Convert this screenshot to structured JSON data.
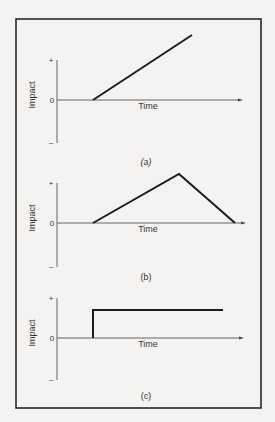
{
  "figure": {
    "frame": {
      "x": 16,
      "y": 19,
      "w": 245,
      "h": 389
    },
    "panels": [
      {
        "id": "a",
        "caption": "(a)",
        "caption_italic": true,
        "y_axis_label": "Impact",
        "x_axis_label": "Time",
        "tick_plus": "+",
        "tick_zero": "0",
        "tick_minus": "–",
        "axis_x": 57,
        "axis_top": 60,
        "zero_y": 100,
        "axis_bottom": 143,
        "arrow_end_x": 243,
        "curve_points": [
          [
            93,
            100
          ],
          [
            192,
            35
          ]
        ],
        "caption_y": 165,
        "time_y": 109
      },
      {
        "id": "b",
        "caption": "(b)",
        "caption_italic": false,
        "y_axis_label": "Impact",
        "x_axis_label": "Time",
        "tick_plus": "+",
        "tick_zero": "0",
        "tick_minus": "–",
        "axis_x": 57,
        "axis_top": 183,
        "zero_y": 223,
        "axis_bottom": 267,
        "arrow_end_x": 246,
        "curve_points": [
          [
            93,
            223
          ],
          [
            179,
            174
          ],
          [
            235,
            223
          ]
        ],
        "caption_y": 280,
        "time_y": 232
      },
      {
        "id": "c",
        "caption": "(c)",
        "caption_italic": false,
        "y_axis_label": "Impact",
        "x_axis_label": "Time",
        "tick_plus": "+",
        "tick_zero": "0",
        "tick_minus": "–",
        "axis_x": 57,
        "axis_top": 298,
        "zero_y": 338,
        "axis_bottom": 380,
        "arrow_end_x": 244,
        "curve_points": [
          [
            93,
            338
          ],
          [
            93,
            310
          ],
          [
            223,
            310
          ]
        ],
        "caption_y": 399,
        "time_y": 347
      }
    ]
  },
  "chart_data": [
    {
      "type": "line",
      "title": "(a)",
      "xlabel": "Time",
      "ylabel": "Impact",
      "y_ticks": [
        "+",
        "0",
        "–"
      ],
      "shape": "gradual permanent increase (ramp)",
      "x": [
        0,
        1
      ],
      "y": [
        0,
        1
      ]
    },
    {
      "type": "line",
      "title": "(b)",
      "xlabel": "Time",
      "ylabel": "Impact",
      "y_ticks": [
        "+",
        "0",
        "–"
      ],
      "shape": "rise then decline (temporary)",
      "x": [
        0,
        0.6,
        1
      ],
      "y": [
        0,
        1,
        0
      ]
    },
    {
      "type": "line",
      "title": "(c)",
      "xlabel": "Time",
      "ylabel": "Impact",
      "y_ticks": [
        "+",
        "0",
        "–"
      ],
      "shape": "abrupt permanent step",
      "x": [
        0,
        0,
        1
      ],
      "y": [
        0,
        1,
        1
      ]
    }
  ]
}
